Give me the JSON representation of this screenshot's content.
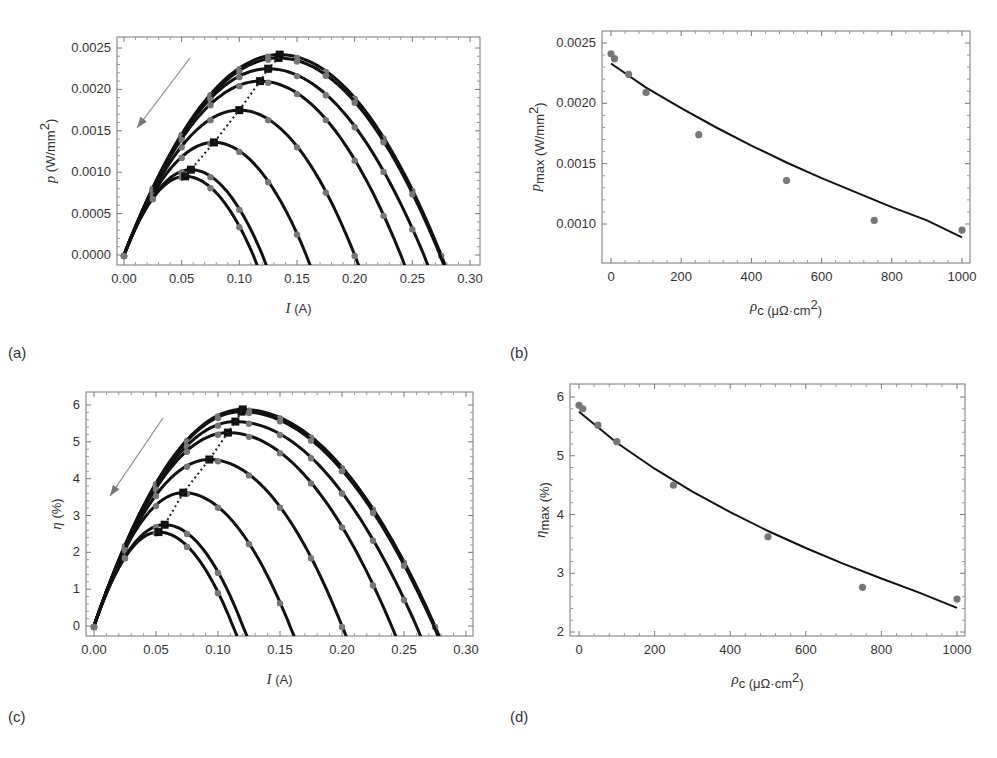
{
  "figure": {
    "panels": [
      {
        "id": "a",
        "label": "(a)",
        "label_pos": [
          8,
          358
        ]
      },
      {
        "id": "b",
        "label": "(b)",
        "label_pos": [
          510,
          358
        ]
      },
      {
        "id": "c",
        "label": "(c)",
        "label_pos": [
          8,
          722
        ]
      },
      {
        "id": "d",
        "label": "(d)",
        "label_pos": [
          510,
          722
        ]
      }
    ]
  },
  "chart_data": [
    {
      "id": "a",
      "type": "line",
      "title": "",
      "xlabel": "I (A)",
      "ylabel": "p (W/mm²)",
      "xlabel_parts": {
        "var": "I",
        "unit": " (A)"
      },
      "ylabel_parts": {
        "var": "p",
        "unit": " (W/mm",
        "sup": "2",
        "close": ")"
      },
      "xlim": [
        0.0,
        0.3
      ],
      "ylim": [
        -0.0001,
        0.0026
      ],
      "xticks": [
        0.0,
        0.05,
        0.1,
        0.15,
        0.2,
        0.25,
        0.3
      ],
      "xtick_labels": [
        "0.00",
        "0.05",
        "0.10",
        "0.15",
        "0.20",
        "0.25",
        "0.30"
      ],
      "yticks": [
        0.0,
        0.0005,
        0.001,
        0.0015,
        0.002,
        0.0025
      ],
      "ytick_labels": [
        "0.0000",
        "0.0005",
        "0.0010",
        "0.0015",
        "0.0020",
        "0.0025"
      ],
      "grid": false,
      "annotations": [
        "arrow indicating increasing contact resistance",
        "dotted line through curve maxima"
      ],
      "series": [
        {
          "name": "curve 1",
          "i_sc": 0.275,
          "p_max": 0.00242,
          "i_max": 0.135
        },
        {
          "name": "curve 2",
          "i_sc": 0.274,
          "p_max": 0.00238,
          "i_max": 0.134
        },
        {
          "name": "curve 3",
          "i_sc": 0.26,
          "p_max": 0.00225,
          "i_max": 0.125
        },
        {
          "name": "curve 4",
          "i_sc": 0.24,
          "p_max": 0.0021,
          "i_max": 0.118
        },
        {
          "name": "curve 5",
          "i_sc": 0.2,
          "p_max": 0.00175,
          "i_max": 0.1
        },
        {
          "name": "curve 6",
          "i_sc": 0.158,
          "p_max": 0.00136,
          "i_max": 0.078
        },
        {
          "name": "curve 7",
          "i_sc": 0.12,
          "p_max": 0.00103,
          "i_max": 0.058
        },
        {
          "name": "curve 8",
          "i_sc": 0.112,
          "p_max": 0.00095,
          "i_max": 0.053
        }
      ],
      "frame": {
        "x0": 117,
        "y0": 37,
        "x1": 480,
        "y1": 265
      },
      "map": {
        "px0": 124,
        "px1": 470,
        "py0": 255,
        "py1": 48,
        "vx0": 0.0,
        "vx1": 0.3,
        "vy0": 0.0,
        "vy1": 0.0025
      },
      "arrow": {
        "x1": 190,
        "y1": 58,
        "x2": 137,
        "y2": 128
      }
    },
    {
      "id": "b",
      "type": "scatter",
      "title": "",
      "xlabel": "ρc (μΩ·cm²)",
      "ylabel": "pmax (W/mm²)",
      "xlabel_parts": {
        "var": "ρ",
        "sub": "c",
        "unit": " (μΩ·cm",
        "sup": "2",
        "close": ")"
      },
      "ylabel_parts": {
        "var": "p",
        "sub": "max",
        "unit": " (W/mm",
        "sup": "2",
        "close": ")"
      },
      "xlim": [
        -20,
        1020
      ],
      "ylim": [
        0.0007,
        0.0026
      ],
      "xticks": [
        0,
        200,
        400,
        600,
        800,
        1000
      ],
      "xtick_labels": [
        "0",
        "200",
        "400",
        "600",
        "800",
        "1000"
      ],
      "yticks": [
        0.001,
        0.0015,
        0.002,
        0.0025
      ],
      "ytick_labels": [
        "0.0010",
        "0.0015",
        "0.0020",
        "0.0025"
      ],
      "grid": false,
      "points": {
        "x": [
          0,
          10,
          50,
          100,
          250,
          500,
          750,
          1000
        ],
        "y": [
          0.00241,
          0.00237,
          0.00224,
          0.00209,
          0.00174,
          0.00136,
          0.00103,
          0.00095
        ]
      },
      "fit": {
        "x": [
          0,
          100,
          200,
          300,
          400,
          500,
          600,
          700,
          800,
          900,
          1000
        ],
        "y": [
          0.00233,
          0.00213,
          0.00196,
          0.0018,
          0.00165,
          0.00151,
          0.00138,
          0.00126,
          0.00114,
          0.00103,
          0.00089
        ]
      },
      "frame": {
        "x0": 602,
        "y0": 31,
        "x1": 970,
        "y1": 263
      },
      "map": {
        "px0": 611,
        "px1": 962,
        "py0": 224,
        "py1": 43,
        "vx0": 0,
        "vx1": 1000,
        "vy0": 0.001,
        "vy1": 0.0025
      }
    },
    {
      "id": "c",
      "type": "line",
      "title": "",
      "xlabel": "I (A)",
      "ylabel": "η (%)",
      "xlabel_parts": {
        "var": "I",
        "unit": " (A)"
      },
      "ylabel_parts": {
        "var": "η",
        "unit": " (%)"
      },
      "xlim": [
        0.0,
        0.3
      ],
      "ylim": [
        -0.3,
        6.3
      ],
      "xticks": [
        0.0,
        0.05,
        0.1,
        0.15,
        0.2,
        0.25,
        0.3
      ],
      "xtick_labels": [
        "0.00",
        "0.05",
        "0.10",
        "0.15",
        "0.20",
        "0.25",
        "0.30"
      ],
      "yticks": [
        0,
        1,
        2,
        3,
        4,
        5,
        6
      ],
      "ytick_labels": [
        "0",
        "1",
        "2",
        "3",
        "4",
        "5",
        "6"
      ],
      "grid": false,
      "annotations": [
        "arrow indicating increasing contact resistance",
        "dotted line through curve maxima"
      ],
      "series": [
        {
          "name": "curve 1",
          "i_sc": 0.275,
          "eta_max": 5.88,
          "i_max": 0.12
        },
        {
          "name": "curve 2",
          "i_sc": 0.274,
          "eta_max": 5.82,
          "i_max": 0.119
        },
        {
          "name": "curve 3",
          "i_sc": 0.26,
          "eta_max": 5.55,
          "i_max": 0.114
        },
        {
          "name": "curve 4",
          "i_sc": 0.24,
          "eta_max": 5.25,
          "i_max": 0.108
        },
        {
          "name": "curve 5",
          "i_sc": 0.2,
          "eta_max": 4.52,
          "i_max": 0.093
        },
        {
          "name": "curve 6",
          "i_sc": 0.158,
          "eta_max": 3.62,
          "i_max": 0.072
        },
        {
          "name": "curve 7",
          "i_sc": 0.12,
          "eta_max": 2.75,
          "i_max": 0.057
        },
        {
          "name": "curve 8",
          "i_sc": 0.112,
          "eta_max": 2.55,
          "i_max": 0.052
        }
      ],
      "frame": {
        "x0": 86,
        "y0": 392,
        "x1": 473,
        "y1": 636
      },
      "map": {
        "px0": 94,
        "px1": 466,
        "py0": 626,
        "py1": 405,
        "vx0": 0.0,
        "vx1": 0.3,
        "vy0": 0,
        "vy1": 6
      },
      "arrow": {
        "x1": 163,
        "y1": 418,
        "x2": 110,
        "y2": 496
      }
    },
    {
      "id": "d",
      "type": "scatter",
      "title": "",
      "xlabel": "ρc (μΩ·cm²)",
      "ylabel": "ηmax (%)",
      "xlabel_parts": {
        "var": "ρ",
        "sub": "c",
        "unit": " (μΩ·cm",
        "sup": "2",
        "close": ")"
      },
      "ylabel_parts": {
        "var": "η",
        "sub": "max",
        "unit": " (%)"
      },
      "xlim": [
        -20,
        1020
      ],
      "ylim": [
        1.9,
        6.3
      ],
      "xticks": [
        0,
        200,
        400,
        600,
        800,
        1000
      ],
      "xtick_labels": [
        "0",
        "200",
        "400",
        "600",
        "800",
        "1000"
      ],
      "yticks": [
        2,
        3,
        4,
        5,
        6
      ],
      "ytick_labels": [
        "2",
        "3",
        "4",
        "5",
        "6"
      ],
      "grid": false,
      "points": {
        "x": [
          0,
          10,
          50,
          100,
          250,
          500,
          750,
          1000
        ],
        "y": [
          5.86,
          5.8,
          5.52,
          5.24,
          4.5,
          3.62,
          2.76,
          2.56
        ]
      },
      "fit": {
        "x": [
          0,
          100,
          200,
          300,
          400,
          500,
          600,
          700,
          800,
          900,
          1000
        ],
        "y": [
          5.75,
          5.22,
          4.78,
          4.39,
          4.04,
          3.72,
          3.43,
          3.16,
          2.91,
          2.67,
          2.41
        ]
      },
      "frame": {
        "x0": 570,
        "y0": 384,
        "x1": 965,
        "y1": 636
      },
      "map": {
        "px0": 579,
        "px1": 957,
        "py0": 632,
        "py1": 397,
        "vx0": 0,
        "vx1": 1000,
        "vy0": 2,
        "vy1": 6
      }
    }
  ]
}
